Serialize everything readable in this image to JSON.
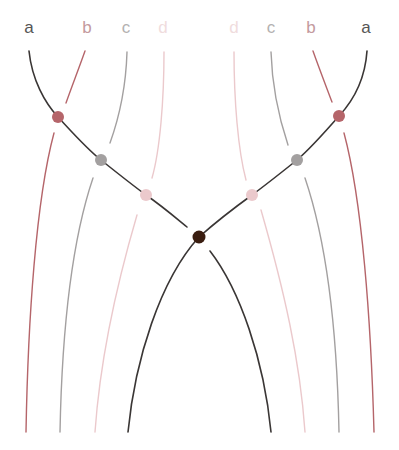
{
  "diagram": {
    "type": "strand-crossing-diagram",
    "colors": {
      "a": "#3a3635",
      "b": "#b5656a",
      "c": "#a3a0a0",
      "d": "#ebc9cc",
      "center": "#3a1d10",
      "label_a": "#555555",
      "label_b": "#c49a9d",
      "label_c": "#b3b1b1",
      "label_d": "#f0dcdd"
    },
    "labels_left": [
      {
        "text": "a",
        "x": 29,
        "color_key": "label_a"
      },
      {
        "text": "b",
        "x": 87,
        "color_key": "label_b"
      },
      {
        "text": "c",
        "x": 126,
        "color_key": "label_c"
      },
      {
        "text": "d",
        "x": 163,
        "color_key": "label_d"
      }
    ],
    "labels_right": [
      {
        "text": "d",
        "x": 234,
        "color_key": "label_d"
      },
      {
        "text": "c",
        "x": 271,
        "color_key": "label_c"
      },
      {
        "text": "b",
        "x": 311,
        "color_key": "label_b"
      },
      {
        "text": "a",
        "x": 366,
        "color_key": "label_a"
      }
    ],
    "nodes": [
      {
        "name": "node-left-b",
        "x": 58,
        "y": 117,
        "color": "#b5656a"
      },
      {
        "name": "node-left-c",
        "x": 101,
        "y": 160,
        "color": "#a3a0a0"
      },
      {
        "name": "node-left-d",
        "x": 146,
        "y": 195,
        "color": "#ebc9cc"
      },
      {
        "name": "node-center",
        "x": 199,
        "y": 237,
        "color": "#3a1d10"
      },
      {
        "name": "node-right-d",
        "x": 252,
        "y": 195,
        "color": "#ebc9cc"
      },
      {
        "name": "node-right-c",
        "x": 297,
        "y": 160,
        "color": "#a3a0a0"
      },
      {
        "name": "node-right-b",
        "x": 339,
        "y": 116,
        "color": "#b5656a"
      }
    ]
  }
}
